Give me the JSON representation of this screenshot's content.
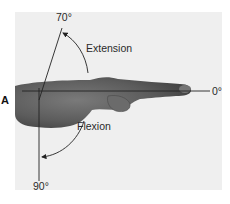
{
  "figure": {
    "panel_label": "A",
    "background_color": "#efefef",
    "line_color": "#333333",
    "hand_color": "#5a5a5a"
  },
  "angles": {
    "extension_angle": "70°",
    "neutral_angle": "0°",
    "flexion_angle": "90°"
  },
  "motions": {
    "extension_label": "Extension",
    "flexion_label": "Flexion"
  }
}
